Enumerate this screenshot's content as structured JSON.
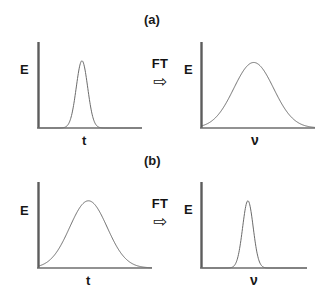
{
  "figure": {
    "background": "#ffffff",
    "axis_color": "#5c5c5c",
    "curve_color": "#6b6b6b",
    "text_color": "#171717"
  },
  "panels": [
    {
      "id": "a",
      "label": "(a)",
      "operator": {
        "text": "FT",
        "arrow_icon": "right-block-arrow",
        "arrow_glyph": "⇨"
      },
      "left_plot": {
        "name": "narrow-time-pulse",
        "ylabel": "E",
        "xlabel": "t",
        "curve": "gaussian",
        "center_frac": 0.42,
        "width_frac": 0.055,
        "peak_frac": 0.8
      },
      "right_plot": {
        "name": "broad-frequency-spectrum",
        "ylabel": "E",
        "xlabel": "ν",
        "curve": "gaussian",
        "center_frac": 0.46,
        "width_frac": 0.175,
        "peak_frac": 0.78
      }
    },
    {
      "id": "b",
      "label": "(b)",
      "operator": {
        "text": "FT",
        "arrow_icon": "right-block-arrow",
        "arrow_glyph": "⇨"
      },
      "left_plot": {
        "name": "broad-time-pulse",
        "ylabel": "E",
        "xlabel": "t",
        "curve": "gaussian",
        "center_frac": 0.44,
        "width_frac": 0.165,
        "peak_frac": 0.8
      },
      "right_plot": {
        "name": "narrow-frequency-spectrum",
        "ylabel": "E",
        "xlabel": "ν",
        "curve": "gaussian",
        "center_frac": 0.44,
        "width_frac": 0.05,
        "peak_frac": 0.8
      }
    }
  ],
  "chart_data": {
    "type": "line",
    "title": "",
    "subtitle": "",
    "grid": false,
    "legend": "none",
    "subplots": [
      {
        "panel": "a",
        "position": "top-left",
        "xlabel": "t",
        "ylabel": "E",
        "xlim": [
          0,
          1
        ],
        "ylim": [
          0,
          1
        ],
        "series": [
          {
            "name": "narrow gaussian pulse",
            "shape": "gaussian",
            "center": 0.42,
            "sigma": 0.055,
            "amplitude": 0.8
          }
        ]
      },
      {
        "panel": "a",
        "position": "top-right",
        "xlabel": "ν",
        "ylabel": "E",
        "xlim": [
          0,
          1
        ],
        "ylim": [
          0,
          1
        ],
        "series": [
          {
            "name": "broad gaussian spectrum",
            "shape": "gaussian",
            "center": 0.46,
            "sigma": 0.175,
            "amplitude": 0.78
          }
        ]
      },
      {
        "panel": "b",
        "position": "bottom-left",
        "xlabel": "t",
        "ylabel": "E",
        "xlim": [
          0,
          1
        ],
        "ylim": [
          0,
          1
        ],
        "series": [
          {
            "name": "broad gaussian pulse",
            "shape": "gaussian",
            "center": 0.44,
            "sigma": 0.165,
            "amplitude": 0.8
          }
        ]
      },
      {
        "panel": "b",
        "position": "bottom-right",
        "xlabel": "ν",
        "ylabel": "E",
        "xlim": [
          0,
          1
        ],
        "ylim": [
          0,
          1
        ],
        "series": [
          {
            "name": "narrow gaussian spectrum",
            "shape": "gaussian",
            "center": 0.44,
            "sigma": 0.05,
            "amplitude": 0.8
          }
        ]
      }
    ]
  }
}
